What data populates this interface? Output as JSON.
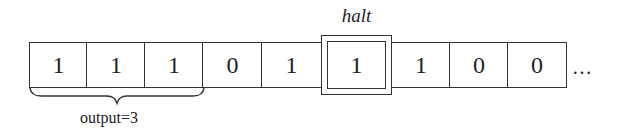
{
  "tape": {
    "cells": [
      "1",
      "1",
      "1",
      "0",
      "1",
      "1",
      "1",
      "0",
      "0"
    ],
    "head_index": 5,
    "continuation": "…"
  },
  "head": {
    "label": "halt"
  },
  "annotation": {
    "label": "output=3",
    "span_cells": 3
  }
}
